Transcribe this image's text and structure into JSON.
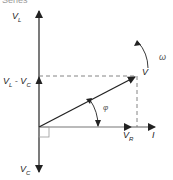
{
  "title": "Series",
  "labels": {
    "vl": {
      "main": "V",
      "sub": "L"
    },
    "vl_minus_vc": {
      "main1": "V",
      "sub1": "L",
      "sep": " - ",
      "main2": "V",
      "sub2": "C"
    },
    "vc": {
      "main": "V",
      "sub": "C"
    },
    "v": "V",
    "vr": {
      "main": "V",
      "sub": "R"
    },
    "i": "I",
    "phi": "φ",
    "omega": "ω"
  },
  "colors": {
    "line": "#222222",
    "dashed": "#777777",
    "square": "#999999"
  }
}
